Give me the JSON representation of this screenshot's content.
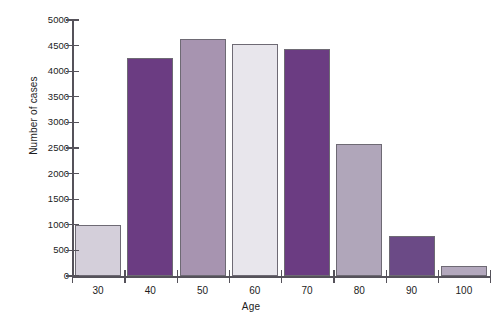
{
  "chart_data": {
    "type": "bar",
    "title": "",
    "subtitle": "",
    "xlabel": "Age",
    "ylabel": "Number of cases",
    "categories": [
      "30",
      "40",
      "50",
      "60",
      "70",
      "80",
      "90",
      "100"
    ],
    "values": [
      990,
      4250,
      4620,
      4530,
      4440,
      2570,
      790,
      190
    ],
    "series": [
      {
        "name": "Number of cases",
        "values": [
          990,
          4250,
          4620,
          4530,
          4440,
          2570,
          790,
          190
        ]
      }
    ],
    "bar_colors": [
      "#d4cfda",
      "#6b3c82",
      "#a794b0",
      "#e8e6ec",
      "#6b3c82",
      "#b0a6ba",
      "#6b4a86",
      "#b3a8bd"
    ],
    "ylim": [
      0,
      5000
    ],
    "ytick_values": [
      0,
      500,
      1000,
      1500,
      2000,
      2500,
      3000,
      3500,
      4000,
      4500,
      5000
    ],
    "ytick_labels": [
      "0",
      "500",
      "1000",
      "1500",
      "2000",
      "2500",
      "3000",
      "3500",
      "4000",
      "4500",
      "5000"
    ],
    "grid": false,
    "legend": null,
    "legend_position": "none",
    "annotations": []
  },
  "axes": {
    "y_title": "Number of cases",
    "x_title": "Age"
  },
  "style": {
    "axis_color": "#55525a",
    "bar_border_color": "#6e6a74",
    "background": "#ffffff",
    "text_color": "#1c1c1c"
  }
}
